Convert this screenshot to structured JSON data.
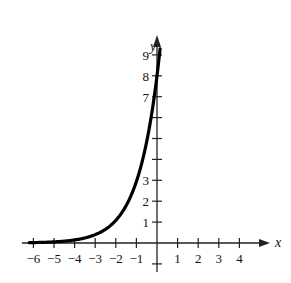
{
  "chart_data": {
    "type": "line",
    "title": "",
    "xlabel": "x",
    "ylabel": "y",
    "function_estimate": "y = 8e^x",
    "xlim": [
      -6.2,
      4.8
    ],
    "ylim": [
      -1,
      10
    ],
    "grid": false,
    "legend": null,
    "x_ticks": [
      -6,
      -5,
      -4,
      -3,
      -2,
      -1,
      1,
      2,
      3,
      4
    ],
    "x_tick_labels": [
      "−6",
      "−5",
      "−4",
      "−3",
      "−2",
      "−1",
      "1",
      "2",
      "3",
      "4"
    ],
    "y_ticks": [
      -1,
      1,
      2,
      3,
      4,
      5,
      6,
      7,
      8,
      9
    ],
    "y_tick_labels": [
      "",
      "1",
      "2",
      "3",
      "",
      "",
      "",
      "7",
      "8",
      "9"
    ],
    "series": [
      {
        "name": "curve",
        "x": [
          -6.2,
          -6,
          -5,
          -4,
          -3,
          -2.5,
          -2,
          -1.5,
          -1,
          -0.5,
          0,
          0.1,
          0.15
        ],
        "y": [
          0.016,
          0.02,
          0.054,
          0.147,
          0.398,
          0.657,
          1.083,
          1.785,
          2.943,
          4.852,
          8.0,
          8.84,
          9.3
        ]
      }
    ]
  },
  "axes": {
    "x_name": "x",
    "y_name": "y"
  },
  "style": {
    "curve_color": "#000000",
    "axis_color": "#222222",
    "background": "#ffffff"
  }
}
